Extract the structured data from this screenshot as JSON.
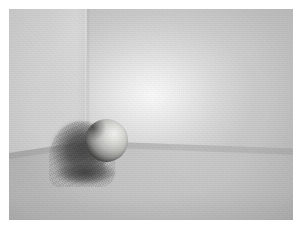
{
  "image": {
    "kind": "rendered-3d-scene",
    "caption": "Global illumination render of a matte sphere resting in the corner of a two-wall room with a soft cast shadow",
    "width": 301,
    "height": 239,
    "border": {
      "color": "#ffffff",
      "left": 9,
      "top": 9,
      "right": 8,
      "bottom": 19
    }
  },
  "scene": {
    "objects": [
      {
        "name": "left-wall",
        "label": "Left side wall",
        "color": "#d2d2d2",
        "shading": "flat, softly lit, slightly brighter toward the corner"
      },
      {
        "name": "right-wall",
        "label": "Back wall",
        "color": "#c3c3c3",
        "shading": "broad diffuse light falloff from a bright hotspot"
      },
      {
        "name": "floor",
        "label": "Floor plane",
        "color": "#b8b8b8",
        "shading": "even mid gray, brightening toward the right"
      },
      {
        "name": "sphere",
        "label": "Matte sphere",
        "color": "#d2d2cf",
        "highlight_color": "#f2f2f0",
        "terminator_color": "#4a4a49",
        "center_x": 106,
        "center_y": 141,
        "diameter": 43
      },
      {
        "name": "cast-shadow",
        "label": "Cast shadow",
        "color": "#3e3e3e",
        "quality": "soft-edged and grainy from stochastic sampling"
      }
    ],
    "light": {
      "name": "key-light",
      "label": "Key light hotspot",
      "hotspot_x": 225,
      "hotspot_y": 95,
      "color": "#ffffff"
    },
    "corner_seam_x": 86,
    "floor_line": {
      "left_y": 185,
      "corner_y": 172,
      "right_y": 181
    },
    "grain": {
      "label": "Monte Carlo render noise",
      "opacity": 0.16
    }
  }
}
